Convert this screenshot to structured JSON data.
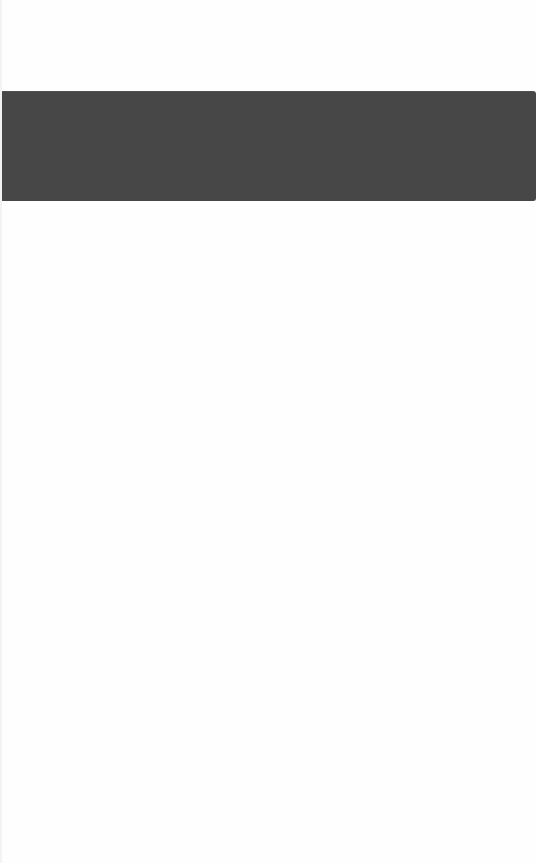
{
  "page": {
    "state": "blank",
    "banner": {
      "text": "",
      "color": "#474747"
    },
    "background_color": "#fefefe"
  }
}
